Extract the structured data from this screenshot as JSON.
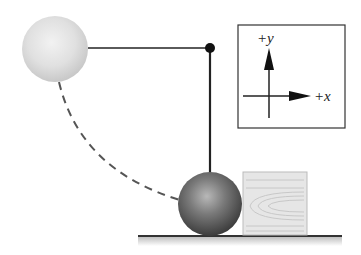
{
  "diagram": {
    "axes": {
      "y_label": "+y",
      "x_label": "+x"
    },
    "objects": {
      "initial_ball": "ball at horizontal release position",
      "final_ball": "ball at bottom of swing",
      "pivot": "pivot point",
      "block": "wooden block",
      "ground": "horizontal surface"
    },
    "colors": {
      "string": "#555555",
      "pivot": "#111111",
      "dashed_path": "#555555",
      "axes_box_border": "#333333",
      "ground": "#333333",
      "block_fill": "#e4e4e4",
      "block_grain": "#bdbdbd"
    }
  }
}
